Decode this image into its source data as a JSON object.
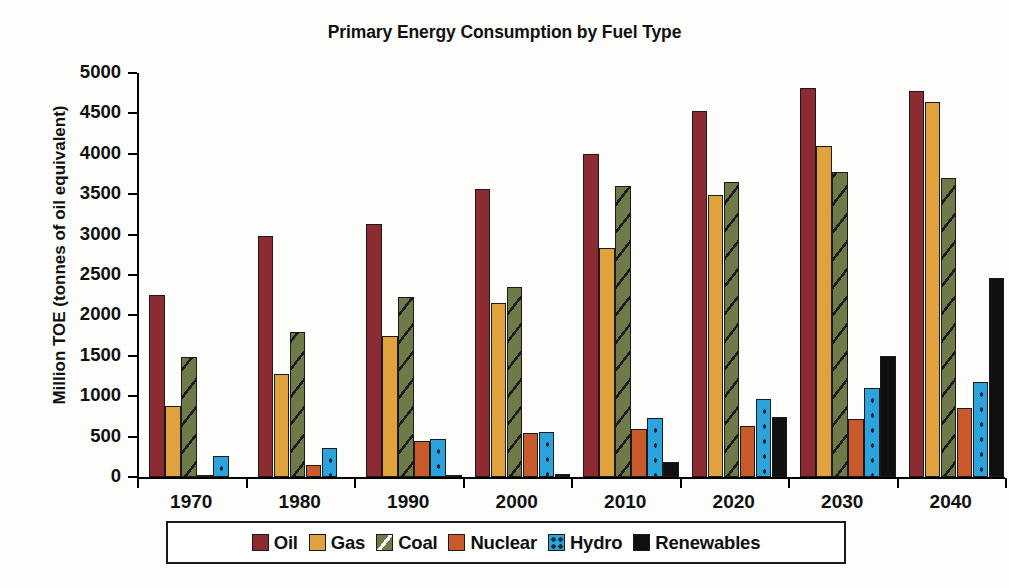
{
  "chart_data": {
    "type": "bar",
    "title": "Primary Energy Consumption by Fuel Type",
    "xlabel": "",
    "ylabel": "Million TOE (tonnes of oil equivalent)",
    "ylim": [
      0,
      5000
    ],
    "ytick_step": 500,
    "yticks": [
      "5000",
      "4500",
      "4000",
      "3500",
      "3000",
      "2500",
      "2000",
      "1500",
      "1000",
      "500",
      "0"
    ],
    "grid": false,
    "legend_position": "bottom",
    "categories": [
      "1970",
      "1980",
      "1990",
      "2000",
      "2010",
      "2020",
      "2030",
      "2040"
    ],
    "series": [
      {
        "name": "Oil",
        "color": "#8C2B32",
        "pattern": "solid",
        "values": [
          2250,
          2980,
          3130,
          3560,
          4000,
          4530,
          4820,
          4780
        ]
      },
      {
        "name": "Gas",
        "color": "#DFA23C",
        "pattern": "solid",
        "values": [
          880,
          1275,
          1740,
          2150,
          2840,
          3490,
          4100,
          4640
        ]
      },
      {
        "name": "Coal",
        "color": "#6F7A49",
        "pattern": "hatch",
        "values": [
          1480,
          1800,
          2230,
          2350,
          3600,
          3650,
          3780,
          3700
        ]
      },
      {
        "name": "Nuclear",
        "color": "#C85A2C",
        "pattern": "solid",
        "values": [
          10,
          150,
          440,
          550,
          590,
          630,
          720,
          850
        ]
      },
      {
        "name": "Hydro",
        "color": "#2BA4DE",
        "pattern": "dotted",
        "values": [
          260,
          360,
          470,
          560,
          730,
          960,
          1100,
          1180
        ]
      },
      {
        "name": "Renewables",
        "color": "#101010",
        "pattern": "solid",
        "values": [
          0,
          0,
          20,
          40,
          180,
          740,
          1500,
          2460
        ]
      }
    ]
  },
  "legend": {
    "items": [
      {
        "label": "Oil",
        "swatch_class": "sw-oil"
      },
      {
        "label": "Gas",
        "swatch_class": "sw-gas"
      },
      {
        "label": "Coal",
        "swatch_class": "sw-coal"
      },
      {
        "label": "Nuclear",
        "swatch_class": "sw-nuclear"
      },
      {
        "label": "Hydro",
        "swatch_class": "sw-hydro"
      },
      {
        "label": "Renewables",
        "swatch_class": "sw-renew"
      }
    ]
  }
}
